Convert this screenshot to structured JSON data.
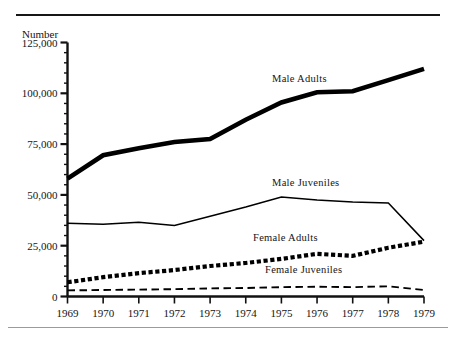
{
  "figure": {
    "y_axis_title": "Number",
    "rules": {
      "top": "divider-rule",
      "bottom": "divider-rule"
    }
  },
  "chart_data": {
    "type": "line",
    "title": "",
    "subtitle": "",
    "xlabel": "",
    "ylabel": "Number",
    "x": [
      "1969",
      "1970",
      "1971",
      "1972",
      "1973",
      "1974",
      "1975",
      "1976",
      "1977",
      "1978",
      "1979"
    ],
    "categories": [
      "1969",
      "1970",
      "1971",
      "1972",
      "1973",
      "1974",
      "1975",
      "1976",
      "1977",
      "1978",
      "1979"
    ],
    "ylim": [
      0,
      125000
    ],
    "xlim": [
      "1969",
      "1979"
    ],
    "y_ticks": [
      0,
      25000,
      50000,
      75000,
      100000,
      125000
    ],
    "y_tick_labels": [
      "0",
      "25,000",
      "50,000",
      "75,000",
      "100,000",
      "125,000"
    ],
    "y_minor_tick_step": 5000,
    "grid": false,
    "legend": "inline-labels",
    "series": [
      {
        "name": "Male Adults",
        "style": "solid-thick",
        "color": "#000000",
        "values": [
          58000,
          69500,
          73000,
          76000,
          77500,
          87000,
          95500,
          100500,
          101000,
          106500,
          112000
        ]
      },
      {
        "name": "Male Juveniles",
        "style": "solid-thin",
        "color": "#000000",
        "values": [
          36000,
          35500,
          36500,
          35000,
          39500,
          44000,
          49000,
          47500,
          46500,
          46000,
          27500
        ]
      },
      {
        "name": "Female Adults",
        "style": "dotted-thick",
        "color": "#000000",
        "values": [
          7000,
          9500,
          11500,
          13000,
          15000,
          16500,
          18500,
          21000,
          20000,
          24000,
          27000
        ]
      },
      {
        "name": "Female Juveniles",
        "style": "dashed",
        "color": "#000000",
        "values": [
          3000,
          3200,
          3400,
          3600,
          4000,
          4200,
          4600,
          4800,
          4600,
          5000,
          3200
        ]
      }
    ]
  }
}
